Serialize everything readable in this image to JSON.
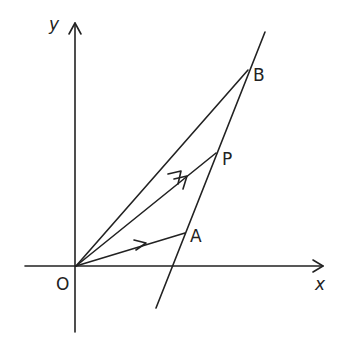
{
  "diagram": {
    "type": "vector-geometry",
    "axes": {
      "x_label": "x",
      "y_label": "y",
      "origin_label": "O"
    },
    "points": {
      "A": {
        "label": "A"
      },
      "P": {
        "label": "P"
      },
      "B": {
        "label": "B"
      }
    },
    "vectors": [
      {
        "from": "O",
        "to": "A"
      },
      {
        "from": "O",
        "to": "P"
      },
      {
        "from": "O",
        "to": "B"
      }
    ],
    "line": {
      "through": [
        "A",
        "P",
        "B"
      ]
    },
    "colors": {
      "ink": "#222222",
      "background": "#ffffff"
    }
  }
}
